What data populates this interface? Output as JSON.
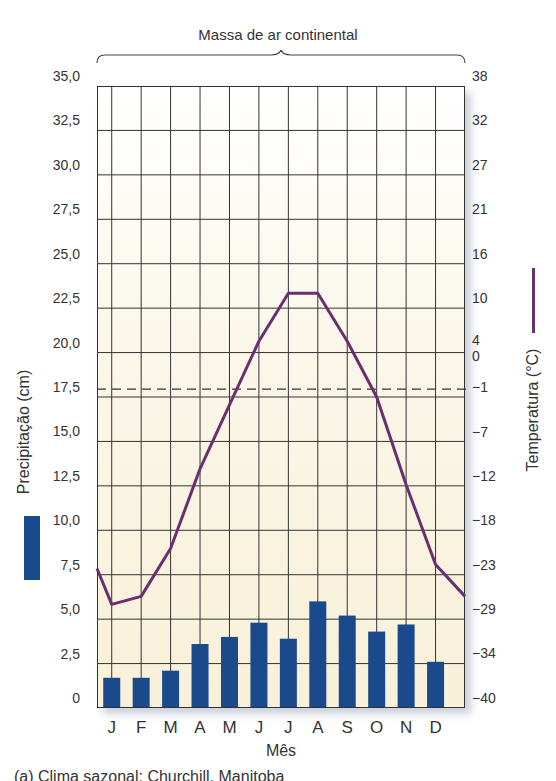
{
  "chart_data": {
    "type": "bar+line",
    "title": "Massa de ar continental",
    "caption": "(a) Clima sazonal: Churchill, Manitoba",
    "xlabel": "Mês",
    "ylabel_left": "Precipitação (cm)",
    "ylabel_right": "Temperatura (°C)",
    "categories": [
      "J",
      "F",
      "M",
      "A",
      "M",
      "J",
      "J",
      "A",
      "S",
      "O",
      "N",
      "D"
    ],
    "series": [
      {
        "name": "Precipitação (cm)",
        "type": "bar",
        "axis": "left",
        "color": "#1b4a8c",
        "values": [
          1.7,
          1.7,
          2.1,
          3.6,
          4.0,
          4.8,
          3.9,
          6.0,
          5.2,
          4.3,
          4.7,
          2.6
        ]
      },
      {
        "name": "Temperatura (°C)",
        "type": "line",
        "axis": "right",
        "color": "#6b2f6f",
        "values": [
          -27,
          -26,
          -20,
          -10,
          -2,
          6,
          12,
          12,
          6,
          -1,
          -12,
          -22
        ]
      }
    ],
    "left_axis": {
      "ticks": [
        "35,0",
        "32,5",
        "30,0",
        "27,5",
        "25,0",
        "22,5",
        "20,0",
        "17,5",
        "15,0",
        "12,5",
        "10,0",
        "7,5",
        "5,0",
        "2,5",
        "0"
      ],
      "ylim": [
        0,
        35
      ]
    },
    "right_axis": {
      "ticks": [
        "38",
        "32",
        "27",
        "21",
        "16",
        "10",
        "4",
        "0",
        "−1",
        "−7",
        "−12",
        "−18",
        "−23",
        "−29",
        "−34",
        "−40"
      ],
      "ylim": [
        -40,
        38
      ]
    },
    "reference_line": {
      "label": "0 °C",
      "style": "dashed"
    },
    "grid": true,
    "legend": {
      "position": "axis-labels",
      "entries": [
        "Precipitação (cm)",
        "Temperatura (°C)"
      ]
    }
  }
}
